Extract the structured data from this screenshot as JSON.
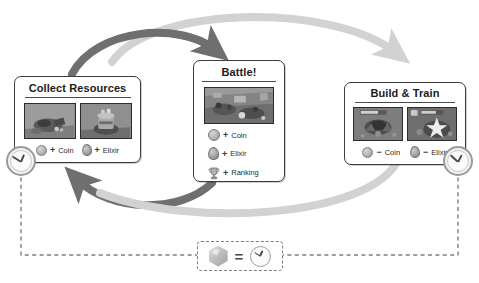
{
  "diagram": {
    "colors": {
      "arrow_dark": "#6f6f6f",
      "arrow_light": "#d2d2d2",
      "panel_border": "#3c3c3c",
      "dashed_line": "#7e7e7e",
      "clock_ring": "#9a9a9a",
      "text": "#1b1b1b"
    }
  },
  "panels": [
    {
      "id": "collect-resources",
      "title": "Collect Resources",
      "thumbs": [
        {
          "name": "gold-mine-thumbnail"
        },
        {
          "name": "elixir-collector-thumbnail"
        }
      ],
      "entries": [
        {
          "icon": "coin-icon",
          "sign": "+",
          "label": "Coin"
        },
        {
          "icon": "elixir-icon",
          "sign": "+",
          "label": "Elixir"
        }
      ]
    },
    {
      "id": "battle",
      "title": "Battle!",
      "thumbs": [
        {
          "name": "battle-scene-thumbnail"
        }
      ],
      "entries": [
        {
          "icon": "coin-icon",
          "sign": "+",
          "label": "Coin"
        },
        {
          "icon": "elixir-icon",
          "sign": "+",
          "label": "Elixir"
        },
        {
          "icon": "trophy-icon",
          "sign": "+",
          "label": "Ranking"
        }
      ]
    },
    {
      "id": "build-train",
      "title": "Build & Train",
      "thumbs": [
        {
          "name": "building-construction-thumbnail"
        },
        {
          "name": "troop-training-thumbnail"
        }
      ],
      "entries": [
        {
          "icon": "coin-icon",
          "sign": "−",
          "label": "Coin"
        },
        {
          "icon": "elixir-icon",
          "sign": "−",
          "label": "Elixir"
        }
      ]
    }
  ],
  "legend": {
    "gem_icon": "gem-icon",
    "operator": "=",
    "clock_icon": "clock-icon"
  },
  "timers": [
    {
      "name": "timer-clock-left"
    },
    {
      "name": "timer-clock-right"
    }
  ]
}
